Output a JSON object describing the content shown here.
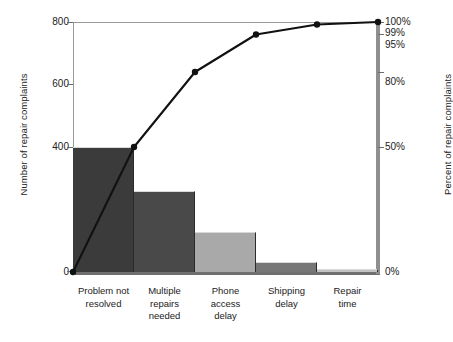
{
  "chart_data": {
    "type": "bar",
    "title": "",
    "subtitle": "",
    "xlabel": "",
    "ylabel": "Number of repair complaints",
    "ylabel_right": "Percent of repair complaints",
    "categories": [
      "Problem not resolved",
      "Multiple repairs needed",
      "Phone access delay",
      "Shipping delay",
      "Repair time"
    ],
    "category_lines": [
      [
        "Problem not",
        "resolved"
      ],
      [
        "Multiple",
        "repairs",
        "needed"
      ],
      [
        "Phone",
        "access",
        "delay"
      ],
      [
        "Shipping",
        "delay"
      ],
      [
        "Repair",
        "time"
      ]
    ],
    "values": [
      400,
      260,
      128,
      32,
      10
    ],
    "series": [
      {
        "name": "Number of repair complaints",
        "values": [
          400,
          260,
          128,
          32,
          10
        ]
      },
      {
        "name": "Cumulative percent of repair complaints",
        "values": [
          50,
          80,
          95,
          99,
          100
        ]
      }
    ],
    "cumulative_percent": [
      50,
      80,
      95,
      99,
      100
    ],
    "ylim": [
      0,
      800
    ],
    "ylim_right": [
      0,
      100
    ],
    "yticks": [
      0,
      400,
      600,
      800
    ],
    "ytick_labels": [
      "0",
      "400",
      "600",
      "800"
    ],
    "yticks_right": [
      0,
      50,
      80,
      95,
      99,
      100
    ],
    "ytick_labels_right": [
      "0%",
      "50%",
      "80%",
      "95%",
      "99%",
      "100%"
    ],
    "grid": false,
    "legend": "none",
    "bar_colors": [
      "#3b3b3b",
      "#494949",
      "#a9a9a9",
      "#767676",
      "#c2c2c2"
    ],
    "line_color": "#111111",
    "marker": "circle"
  },
  "axis": {
    "left_title": "Number of repair complaints",
    "right_title": "Percent of repair complaints"
  }
}
